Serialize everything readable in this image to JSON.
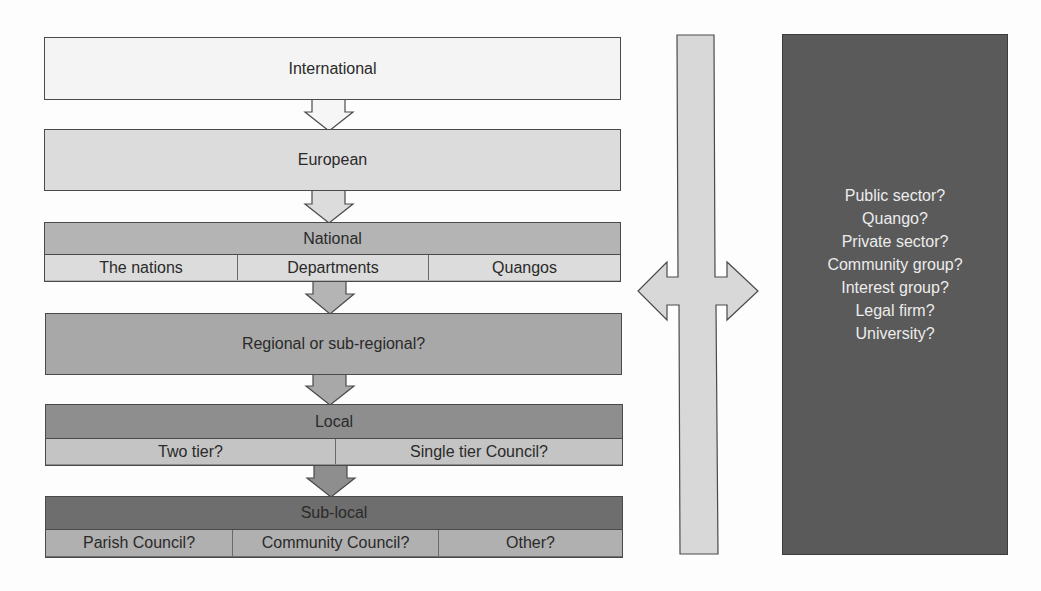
{
  "diagram": {
    "levels": [
      {
        "id": "international",
        "title": "International",
        "subdivisions": []
      },
      {
        "id": "european",
        "title": "European",
        "subdivisions": []
      },
      {
        "id": "national",
        "title": "National",
        "subdivisions": [
          "The nations",
          "Departments",
          "Quangos"
        ]
      },
      {
        "id": "regional",
        "title": "Regional or sub-regional?",
        "subdivisions": []
      },
      {
        "id": "local",
        "title": "Local",
        "subdivisions": [
          "Two tier?",
          "Single tier Council?"
        ]
      },
      {
        "id": "sub-local",
        "title": "Sub-local",
        "subdivisions": [
          "Parish Council?",
          "Community Council?",
          "Other?"
        ]
      }
    ],
    "connector": {
      "type": "vertical-bar-with-bidirectional-arrow"
    },
    "organisations": {
      "items": [
        "Public sector?",
        "Quango?",
        "Private sector?",
        "Community group?",
        "Interest group?",
        "Legal firm?",
        "University?"
      ]
    },
    "colors": {
      "international": "#f4f4f4",
      "european": "#dcdcdc",
      "national_header": "#b4b4b4",
      "national_row": "#dcdcdc",
      "regional": "#a8a8a8",
      "local_header": "#8e8e8e",
      "local_row": "#c4c4c4",
      "sublocal_header": "#6e6e6e",
      "sublocal_row": "#b0b0b0",
      "connector": "#d8d8d8",
      "organisations_box": "#5a5a5a"
    }
  }
}
